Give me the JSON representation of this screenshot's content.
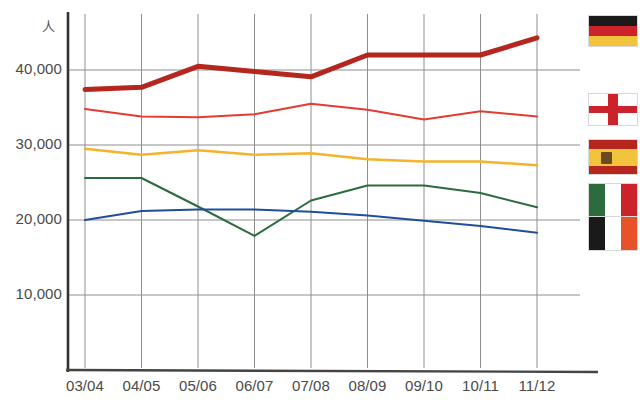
{
  "chart_data": {
    "type": "line",
    "title": "",
    "subtitle": "",
    "xlabel": "",
    "ylabel": "人",
    "y_unit_label": "人",
    "categories": [
      "03/04",
      "04/05",
      "05/06",
      "06/07",
      "07/08",
      "08/09",
      "09/10",
      "10/11",
      "11/12"
    ],
    "ytick_labels": [
      "40,000",
      "30,000",
      "20,000",
      "10,000"
    ],
    "ytick_values": [
      40000,
      30000,
      20000,
      10000
    ],
    "ylim": [
      0,
      46000
    ],
    "grid": true,
    "legend_position": "right",
    "series": [
      {
        "name": "Germany",
        "legend_icon": "flag-germany",
        "color": "#b5261e",
        "linewidth": 5,
        "values": [
          37400,
          37700,
          40500,
          39800,
          39100,
          42000,
          42000,
          42000,
          44300
        ]
      },
      {
        "name": "England",
        "legend_icon": "flag-england",
        "color": "#e43b35",
        "linewidth": 2,
        "values": [
          34800,
          33800,
          33700,
          34100,
          35500,
          34700,
          33400,
          34500,
          33800
        ]
      },
      {
        "name": "Spain",
        "legend_icon": "flag-spain",
        "color": "#f5b32b",
        "linewidth": 2.5,
        "values": [
          29500,
          28700,
          29300,
          28700,
          28900,
          28100,
          27800,
          27800,
          27300
        ]
      },
      {
        "name": "Italy",
        "legend_icon": "flag-italy",
        "color": "#2b6b3d",
        "linewidth": 2,
        "values": [
          25600,
          25600,
          21800,
          17900,
          22600,
          24600,
          24600,
          23600,
          21700
        ]
      },
      {
        "name": "Ireland",
        "legend_icon": "flag-ireland",
        "color": "#1f4e9c",
        "linewidth": 2,
        "values": [
          20000,
          21200,
          21400,
          21400,
          21100,
          20600,
          19900,
          19200,
          18300
        ]
      }
    ]
  },
  "legend": {
    "flags": [
      {
        "key": "flag-germany",
        "name": "Germany",
        "colors": [
          "#1a1a1a",
          "#cc2229",
          "#f2c43d"
        ]
      },
      {
        "key": "flag-england",
        "name": "England",
        "colors": [
          "#ffffff",
          "#cc2229"
        ]
      },
      {
        "key": "flag-spain",
        "name": "Spain",
        "colors": [
          "#b5261e",
          "#f2c43d",
          "#b5261e"
        ]
      },
      {
        "key": "flag-italy",
        "name": "Italy",
        "colors": [
          "#2b6b3d",
          "#ffffff",
          "#cc2229"
        ]
      },
      {
        "key": "flag-ireland",
        "name": "Ireland",
        "colors": [
          "#1a1a1a",
          "#ffffff",
          "#e8522a"
        ]
      }
    ]
  },
  "axis": {
    "unit": "人"
  }
}
